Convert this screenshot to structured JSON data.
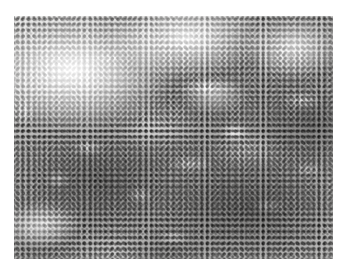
{
  "figure": {
    "kind": "micrograph",
    "modality": "light-microscopy",
    "stain": "hematoxylin-and-eosin",
    "rendering": "grayscale",
    "caption": "",
    "scale_bar": "",
    "magnification_label": "",
    "annotations": [],
    "overlay_text": []
  },
  "canvas": {
    "width_px": 340,
    "height_px": 271,
    "page_background": "#ffffff"
  },
  "plate": {
    "left_px": 14,
    "top_px": 16,
    "width_px": 319,
    "height_px": 243,
    "border": "none"
  },
  "palette": {
    "page": "#ffffff",
    "lightest_tissue": "#f4f3f1",
    "mid_tissue": "#b9b6b2",
    "dark_tissue": "#8d8a86",
    "nucleus_dark": "#3a3836",
    "nucleus_rim": "#46443f",
    "sinusoid_white": "#fdfdfc"
  },
  "content": {
    "description": "Densely cellular tissue section composed of small round cells with dark staining nuclear rims and paler centres, arranged in confluent sheets separated by irregular pale sinusoidal channels.",
    "cell_shape": "round",
    "approx_cell_diameter_px": 5,
    "regions": [
      {
        "name": "upper-left-pale-zone",
        "density": "sparse",
        "tone": "light"
      },
      {
        "name": "upper-centre-pale-zone",
        "density": "sparse",
        "tone": "light"
      },
      {
        "name": "upper-right-zone",
        "density": "moderate",
        "tone": "light-mid"
      },
      {
        "name": "central-band",
        "density": "dense",
        "tone": "mid"
      },
      {
        "name": "lower-left-zone",
        "density": "dense",
        "tone": "mid-dark"
      },
      {
        "name": "lower-right-zone",
        "density": "very-dense",
        "tone": "dark"
      },
      {
        "name": "bottom-edge-zone",
        "density": "moderate",
        "tone": "mid"
      }
    ],
    "sinusoid_channels": "irregular branching pale spaces coursing diagonally from upper-left to lower-right"
  }
}
